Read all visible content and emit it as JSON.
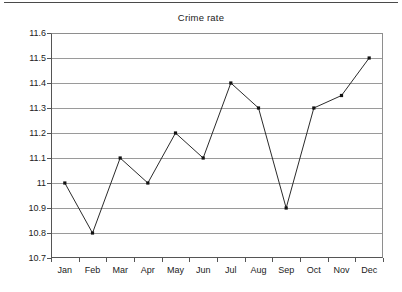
{
  "chart_data": {
    "type": "line",
    "title": "Crime rate",
    "xlabel": "",
    "ylabel": "",
    "categories": [
      "Jan",
      "Feb",
      "Mar",
      "Apr",
      "May",
      "Jun",
      "Jul",
      "Aug",
      "Sep",
      "Oct",
      "Nov",
      "Dec"
    ],
    "values": [
      11,
      10.8,
      11.1,
      11,
      11.2,
      11.1,
      11.4,
      11.3,
      10.9,
      11.3,
      11.35,
      11.5
    ],
    "series": [
      {
        "name": "Crime rate",
        "values": [
          11,
          10.8,
          11.1,
          11,
          11.2,
          11.1,
          11.4,
          11.3,
          10.9,
          11.3,
          11.35,
          11.5
        ]
      }
    ],
    "ylim": [
      10.7,
      11.6
    ],
    "y_ticks": [
      11.6,
      11.5,
      11.4,
      11.3,
      11.2,
      11.1,
      11,
      10.9,
      10.8,
      10.7
    ],
    "y_tick_labels": [
      "11.6",
      "11.5",
      "11.4",
      "11.3",
      "11.2",
      "11.1",
      "11",
      "10.9",
      "10.8",
      "10.7"
    ],
    "grid": true,
    "legend": false,
    "markers": true,
    "marker_style": "square",
    "line_color": "#2b2b2b",
    "grid_color": "#9a9a9a",
    "axis_color": "#555555",
    "background": "#ffffff"
  },
  "header": {
    "rule_color": "#4a4a4a"
  }
}
